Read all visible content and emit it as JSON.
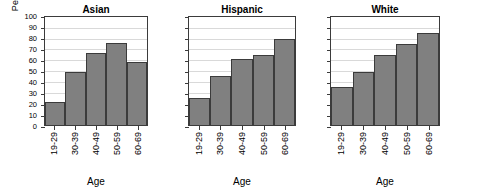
{
  "chart_data": {
    "type": "bar",
    "title": "",
    "xlabel": "Age",
    "ylabel": "Percent",
    "ylim": [
      0,
      100
    ],
    "ytick_values": [
      0,
      10,
      20,
      30,
      40,
      50,
      60,
      70,
      80,
      90,
      100
    ],
    "ytick_labels": [
      "0",
      "10",
      "20",
      "30",
      "40",
      "50",
      "60",
      "70",
      "80",
      "90",
      "100"
    ],
    "grid": true,
    "legend": "none",
    "categories": [
      "19-29",
      "30-39",
      "40-49",
      "50-59",
      "60-69"
    ],
    "bar_color": "#808080",
    "bar_edge_color": "#3b3b3b",
    "gridline_color": "#d9d9d9",
    "panel_layout": "1x3 facets",
    "panels": [
      {
        "label": "Asian",
        "xlabel": "Age",
        "categories": [
          "19-29",
          "30-39",
          "40-49",
          "50-59",
          "60-69"
        ],
        "values": [
          21,
          49,
          67,
          76,
          58
        ]
      },
      {
        "label": "Hispanic",
        "xlabel": "Age",
        "categories": [
          "19-29",
          "30-39",
          "40-49",
          "50-59",
          "60-69"
        ],
        "values": [
          25,
          45,
          61,
          65,
          80
        ]
      },
      {
        "label": "White",
        "xlabel": "Age",
        "categories": [
          "19-29",
          "30-39",
          "40-49",
          "50-59",
          "60-69"
        ],
        "values": [
          35,
          49,
          65,
          75,
          85
        ]
      }
    ]
  }
}
